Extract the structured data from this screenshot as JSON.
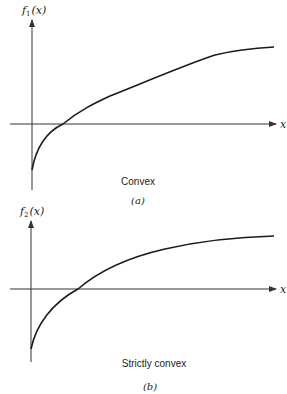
{
  "panels": [
    {
      "id": "a",
      "y_label_fn": "f",
      "y_label_sub": "1",
      "y_label_arg": "(x)",
      "x_label": "x",
      "caption": "Convex",
      "tag": "(a)"
    },
    {
      "id": "b",
      "y_label_fn": "f",
      "y_label_sub": "2",
      "y_label_arg": "(x)",
      "x_label": "x",
      "caption": "Strictly convex",
      "tag": "(b)"
    }
  ]
}
